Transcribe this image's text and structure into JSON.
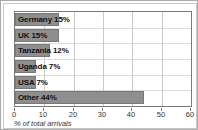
{
  "chart_data": {
    "type": "bar",
    "orientation": "horizontal",
    "title": "",
    "xlabel": "% of total arrivals",
    "ylabel": "",
    "xlim": [
      0,
      60
    ],
    "xticks": [
      0,
      10,
      20,
      30,
      40,
      50,
      60
    ],
    "grid": true,
    "legend": "none",
    "categories": [
      "Germany",
      "UK",
      "Tanzania",
      "Uganda",
      "USA",
      "Other"
    ],
    "values": [
      15,
      15,
      12,
      7,
      7,
      44
    ],
    "bar_labels": [
      "Germany 15%",
      "UK 15%",
      "Tanzania 12%",
      "Uganda 7%",
      "USA 7%",
      "Other 44%"
    ],
    "bar_color": "#8e8e8e",
    "bar_edge_color": "#787878",
    "grid_color": "#c9c9c9",
    "axis_color": "#7a7a7a",
    "text_color": "#111111"
  }
}
